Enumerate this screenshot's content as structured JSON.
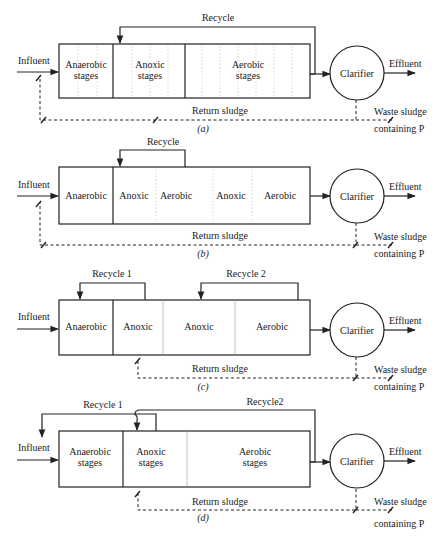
{
  "figure": {
    "diagrams": [
      {
        "caption": "(a)",
        "influent": "Influent",
        "effluent": "Effluent",
        "clarifier": "Clarifier",
        "return_sludge": "Return sludge",
        "waste_sludge_line1": "Waste sludge",
        "waste_sludge_line2": "containing P",
        "recycles": [
          {
            "label": "Recycle"
          }
        ],
        "zones": [
          {
            "line1": "Anaerobic",
            "line2": "stages"
          },
          {
            "line1": "Anoxic",
            "line2": "stages"
          },
          {
            "line1": "Aerobic",
            "line2": "stages"
          }
        ]
      },
      {
        "caption": "(b)",
        "influent": "Influent",
        "effluent": "Effluent",
        "clarifier": "Clarifier",
        "return_sludge": "Return sludge",
        "waste_sludge_line1": "Waste sludge",
        "waste_sludge_line2": "containing P",
        "recycles": [
          {
            "label": "Recycle"
          }
        ],
        "zones": [
          {
            "line1": "Anaerobic"
          },
          {
            "line1": "Anoxic"
          },
          {
            "line1": "Aerobic"
          },
          {
            "line1": "Anoxic"
          },
          {
            "line1": "Aerobic"
          }
        ]
      },
      {
        "caption": "(c)",
        "influent": "Influent",
        "effluent": "Effluent",
        "clarifier": "Clarifier",
        "return_sludge": "Return sludge",
        "waste_sludge_line1": "Waste sludge",
        "waste_sludge_line2": "containing P",
        "recycles": [
          {
            "label": "Recycle 1"
          },
          {
            "label": "Recycle 2"
          }
        ],
        "zones": [
          {
            "line1": "Anaerobic"
          },
          {
            "line1": "Anoxic"
          },
          {
            "line1": "Anoxic"
          },
          {
            "line1": "Aerobic"
          }
        ]
      },
      {
        "caption": "(d)",
        "influent": "Influent",
        "effluent": "Effluent",
        "clarifier": "Clarifier",
        "return_sludge": "Return sludge",
        "waste_sludge_line1": "Waste sludge",
        "waste_sludge_line2": "containing P",
        "recycles": [
          {
            "label": "Recycle 1"
          },
          {
            "label": "Recycle2"
          }
        ],
        "zones": [
          {
            "line1": "Anaerobic",
            "line2": "stages"
          },
          {
            "line1": "Anoxic",
            "line2": "stages"
          },
          {
            "line1": "Aerobic",
            "line2": "stages"
          }
        ]
      }
    ]
  }
}
